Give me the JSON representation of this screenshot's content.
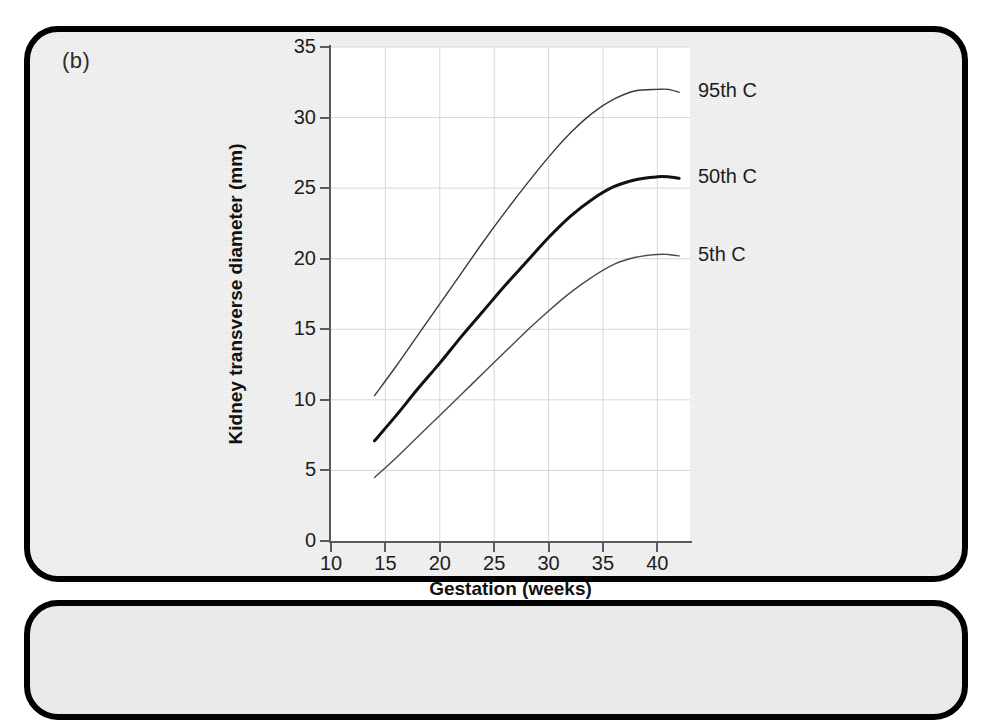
{
  "figure": {
    "panel_letter": "(b)"
  },
  "chart_data": {
    "type": "line",
    "title": "",
    "xlabel": "Gestation (weeks)",
    "ylabel": "Kidney transverse diameter (mm)",
    "xlim": [
      10,
      43
    ],
    "ylim": [
      0,
      35
    ],
    "xticks": [
      10,
      15,
      20,
      25,
      30,
      35,
      40
    ],
    "yticks": [
      0,
      5,
      10,
      15,
      20,
      25,
      30,
      35
    ],
    "grid": true,
    "grid_color": "#d8d8d8",
    "plot_background": "#ffffff",
    "legend_position": "right-of-line-ends",
    "series": [
      {
        "name": "95th C",
        "label": "95th C",
        "color": "#3a3a3a",
        "linewidth": 1.4,
        "x": [
          14,
          16,
          18,
          20,
          22,
          24,
          26,
          28,
          30,
          32,
          34,
          36,
          38,
          40,
          41,
          42
        ],
        "values": [
          10.3,
          12.4,
          14.6,
          16.8,
          19.0,
          21.2,
          23.3,
          25.3,
          27.2,
          28.9,
          30.3,
          31.3,
          31.9,
          32.0,
          32.0,
          31.8
        ]
      },
      {
        "name": "50th C",
        "label": "50th C",
        "color": "#111111",
        "linewidth": 3.0,
        "x": [
          14,
          16,
          18,
          20,
          22,
          24,
          26,
          28,
          30,
          32,
          34,
          36,
          38,
          40,
          41,
          42
        ],
        "values": [
          7.1,
          8.9,
          10.8,
          12.6,
          14.5,
          16.3,
          18.1,
          19.8,
          21.5,
          23.0,
          24.2,
          25.1,
          25.6,
          25.8,
          25.8,
          25.7
        ]
      },
      {
        "name": "5th C",
        "label": "5th C",
        "color": "#4a4a4a",
        "linewidth": 1.4,
        "x": [
          14,
          16,
          18,
          20,
          22,
          24,
          26,
          28,
          30,
          32,
          34,
          36,
          38,
          40,
          41,
          42
        ],
        "values": [
          4.5,
          5.9,
          7.4,
          8.9,
          10.4,
          11.9,
          13.4,
          14.9,
          16.3,
          17.6,
          18.7,
          19.6,
          20.1,
          20.3,
          20.3,
          20.2
        ]
      }
    ]
  }
}
